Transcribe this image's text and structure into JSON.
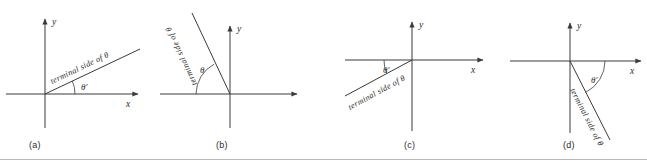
{
  "figure": {
    "caption_rule": true,
    "stroke_color": "#3a3a3a",
    "text_color": "#2b2b2b"
  },
  "panels": [
    {
      "id": "a",
      "label": "(a)",
      "x_axis_label": "x",
      "y_axis_label": "y",
      "angle_label": "θ′",
      "terminal_label": "terminal side of θ",
      "quadrant": "I",
      "terminal_angle_deg": 25,
      "reference_angle_label_position": "above positive x-axis"
    },
    {
      "id": "b",
      "label": "(b)",
      "x_axis_label": "",
      "y_axis_label": "y",
      "angle_label": "θ",
      "terminal_label": "terminal side of θ",
      "quadrant": "II",
      "terminal_angle_deg": 115,
      "reference_angle_label_position": "between negative x-axis and terminal side"
    },
    {
      "id": "c",
      "label": "(c)",
      "x_axis_label": "x",
      "y_axis_label": "y",
      "angle_label": "θ′",
      "terminal_label": "terminal side of θ",
      "quadrant": "III",
      "terminal_angle_deg": 200,
      "reference_angle_label_position": "below negative x-axis"
    },
    {
      "id": "d",
      "label": "(d)",
      "x_axis_label": "x",
      "y_axis_label": "y",
      "angle_label": "θ′",
      "terminal_label": "terminal side of θ",
      "quadrant": "IV",
      "terminal_angle_deg": -63,
      "reference_angle_label_position": "below positive x-axis"
    }
  ]
}
